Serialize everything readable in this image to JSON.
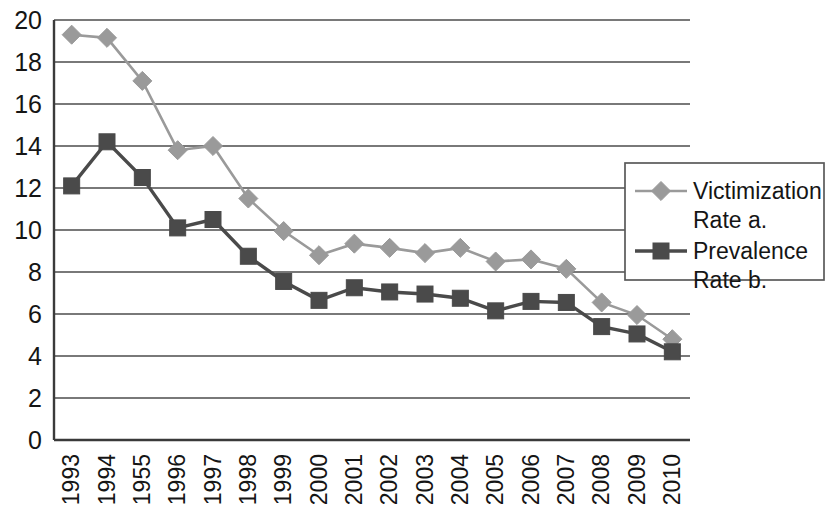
{
  "chart_data": {
    "type": "line",
    "title": "",
    "subtitle": "",
    "xlabel": "",
    "ylabel": "",
    "ylim": [
      0,
      20
    ],
    "ytick_step": 2,
    "grid": true,
    "legend_position": "right-inside",
    "categories": [
      "1993",
      "1994",
      "1955",
      "1996",
      "1997",
      "1998",
      "1999",
      "2000",
      "2001",
      "2002",
      "2003",
      "2004",
      "2005",
      "2006",
      "2007",
      "2008",
      "2009",
      "2010"
    ],
    "ytick_labels": [
      "0",
      "2",
      "4",
      "6",
      "8",
      "10",
      "12",
      "14",
      "16",
      "18",
      "20"
    ],
    "series": [
      {
        "name": "Victimization Rate a.",
        "color": "#9a9a9a",
        "marker": "diamond",
        "values": [
          19.3,
          19.15,
          17.1,
          13.8,
          14.0,
          11.5,
          9.95,
          8.8,
          9.35,
          9.15,
          8.9,
          9.15,
          8.5,
          8.6,
          8.15,
          6.55,
          5.95,
          4.8
        ]
      },
      {
        "name": "Prevalence Rate b.",
        "color": "#4a4a4a",
        "marker": "square",
        "values": [
          12.1,
          14.2,
          12.5,
          10.1,
          10.5,
          8.75,
          7.55,
          6.65,
          7.25,
          7.05,
          6.95,
          6.75,
          6.15,
          6.6,
          6.55,
          5.4,
          5.05,
          4.2
        ]
      }
    ]
  },
  "legend": {
    "entries": [
      {
        "line1": "Victimization",
        "line2": "Rate a."
      },
      {
        "line1": "Prevalence",
        "line2": "Rate b."
      }
    ]
  },
  "colors": {
    "series_light": "#9a9a9a",
    "series_dark": "#4a4a4a",
    "grid": "#4c4c4c",
    "axis": "#3a3a3a",
    "text": "#151515",
    "background": "#ffffff"
  }
}
